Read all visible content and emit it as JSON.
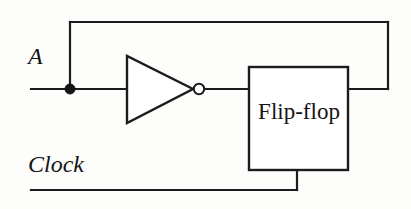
{
  "diagram": {
    "type": "logic-circuit-schematic",
    "background_color": "#fdfdfc",
    "line_color": "#1c1c1c",
    "labels": {
      "input_signal": "A",
      "clock_signal": "Clock",
      "block": "Flip-flop"
    },
    "components": [
      {
        "name": "inverter-gate",
        "kind": "NOT gate",
        "shape": "triangle-with-bubble",
        "triangle": {
          "x1": 127,
          "y1": 56,
          "x2": 127,
          "y2": 123,
          "apex_x": 193,
          "apex_y": 89
        },
        "bubble": {
          "cx": 199,
          "cy": 89,
          "r": 5.2
        }
      },
      {
        "name": "flip-flop-block",
        "kind": "rectangle",
        "rect": {
          "x": 249,
          "y": 67,
          "width": 99,
          "height": 103
        },
        "label": "Flip-flop"
      },
      {
        "name": "junction-dot",
        "kind": "wire-junction",
        "point": {
          "cx": 70,
          "cy": 89,
          "r": 5.0
        }
      }
    ],
    "wires": [
      {
        "name": "input-wire-a",
        "path": "M31,89 H127"
      },
      {
        "name": "feedback-riser-left",
        "path": "M70,89 V22"
      },
      {
        "name": "feedback-top-wire",
        "path": "M70,22 H388"
      },
      {
        "name": "feedback-riser-right",
        "path": "M388,22 V89"
      },
      {
        "name": "feedback-return-wire",
        "path": "M388,89 H348"
      },
      {
        "name": "inverter-output-wire",
        "path": "M204,89 H249"
      },
      {
        "name": "clock-wire",
        "path": "M31,190 H297"
      },
      {
        "name": "clock-riser",
        "path": "M297,190 V170"
      }
    ]
  }
}
